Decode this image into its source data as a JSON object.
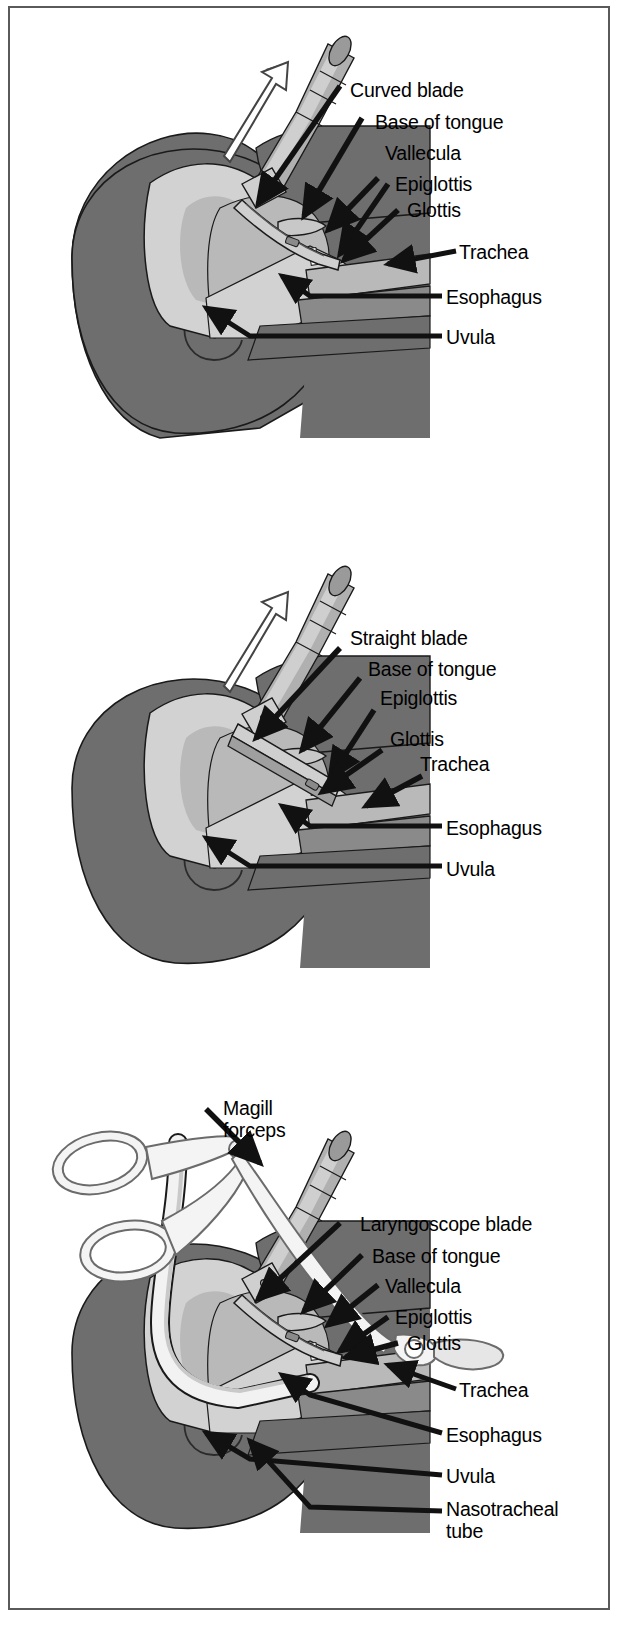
{
  "figure": {
    "border_color": "#5a5a5a",
    "background": "#ffffff",
    "palette": {
      "tissue_dark": "#6e6e6e",
      "tissue_mid": "#8a8a8a",
      "tissue_light": "#b9b9b9",
      "tissue_pale": "#d2d2d2",
      "metal_light": "#cfcfcf",
      "metal_mid": "#a8a8a8",
      "outline": "#1a1a1a",
      "white": "#ffffff"
    }
  },
  "panels": [
    {
      "id": "panel-curved-blade",
      "instrument": "laryngoscope with curved (Macintosh) blade",
      "lift_arrow": "upward open arrow",
      "labels": [
        {
          "text": "Curved blade",
          "x": 340,
          "y": 82
        },
        {
          "text": "Base of tongue",
          "x": 365,
          "y": 113
        },
        {
          "text": "Vallecula",
          "x": 375,
          "y": 144
        },
        {
          "text": "Epiglottis",
          "x": 385,
          "y": 175
        },
        {
          "text": "Glottis",
          "x": 397,
          "y": 200
        },
        {
          "text": "Trachea",
          "x": 455,
          "y": 245
        },
        {
          "text": "Esophagus",
          "x": 440,
          "y": 290
        },
        {
          "text": "Uvula",
          "x": 440,
          "y": 330
        }
      ]
    },
    {
      "id": "panel-straight-blade",
      "instrument": "laryngoscope with straight (Miller) blade",
      "lift_arrow": "upward open arrow",
      "labels": [
        {
          "text": "Straight blade",
          "x": 340,
          "y": 630
        },
        {
          "text": "Base of tongue",
          "x": 360,
          "y": 661
        },
        {
          "text": "Epiglottis",
          "x": 370,
          "y": 689
        },
        {
          "text": "Glottis",
          "x": 380,
          "y": 730
        },
        {
          "text": "Trachea",
          "x": 410,
          "y": 755
        },
        {
          "text": "Esophagus",
          "x": 440,
          "y": 820
        },
        {
          "text": "Uvula",
          "x": 440,
          "y": 860
        }
      ]
    },
    {
      "id": "panel-nasotracheal",
      "instrument": "laryngoscope blade with Magill forceps and nasotracheal tube",
      "labels": [
        {
          "text": "Magill\nforceps",
          "x": 215,
          "y": 1098,
          "lines": 2
        },
        {
          "text": "Laryngoscope blade",
          "x": 355,
          "y": 1215
        },
        {
          "text": "Base of tongue",
          "x": 365,
          "y": 1247
        },
        {
          "text": "Vallecula",
          "x": 375,
          "y": 1277
        },
        {
          "text": "Epiglottis",
          "x": 385,
          "y": 1308
        },
        {
          "text": "Glottis",
          "x": 397,
          "y": 1333
        },
        {
          "text": "Trachea",
          "x": 455,
          "y": 1382
        },
        {
          "text": "Esophagus",
          "x": 440,
          "y": 1427
        },
        {
          "text": "Uvula",
          "x": 440,
          "y": 1468
        },
        {
          "text": "Nasotracheal\ntube",
          "x": 440,
          "y": 1500,
          "lines": 2
        }
      ]
    }
  ]
}
